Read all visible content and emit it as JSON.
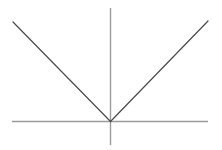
{
  "figure": {
    "width": 222,
    "height": 150,
    "background_color": "#ffffff",
    "title": "",
    "has_border": false,
    "has_labels": false,
    "has_tick_marks": false,
    "has_gridlines": false,
    "has_legend": false
  },
  "axes": {
    "x_axis": {
      "name": "x-axis",
      "color": "#9a9a9a",
      "width": 1.4,
      "x1": 12,
      "y1": 121.5,
      "x2": 208,
      "y2": 121.5,
      "label": ""
    },
    "y_axis": {
      "name": "y-axis",
      "color": "#9a9a9a",
      "width": 1.4,
      "x1": 110.5,
      "y1": 8,
      "x2": 110.5,
      "y2": 145,
      "label": ""
    },
    "origin": {
      "x": 110.5,
      "y": 121.5,
      "label": ""
    }
  },
  "chart_data": {
    "type": "line",
    "title": "",
    "xlabel": "",
    "ylabel": "",
    "function": "y = |x|",
    "grid": false,
    "legend": null,
    "xlim": [
      -1.0,
      1.0
    ],
    "ylim": [
      -0.38,
      1.17
    ],
    "series": [
      {
        "name": "y = |x| (left branch)",
        "color": "#4a4a4a",
        "line_width": 1.2,
        "x": [
          -1.0,
          0.0
        ],
        "y": [
          1.02,
          0.0
        ],
        "pixel_points": [
          [
            13,
            22
          ],
          [
            110.5,
            121.5
          ]
        ]
      },
      {
        "name": "y = |x| (right branch)",
        "color": "#4a4a4a",
        "line_width": 1.2,
        "x": [
          0.0,
          1.0
        ],
        "y": [
          0.0,
          1.03
        ],
        "pixel_points": [
          [
            110.5,
            121.5
          ],
          [
            208,
            21
          ]
        ]
      }
    ]
  }
}
